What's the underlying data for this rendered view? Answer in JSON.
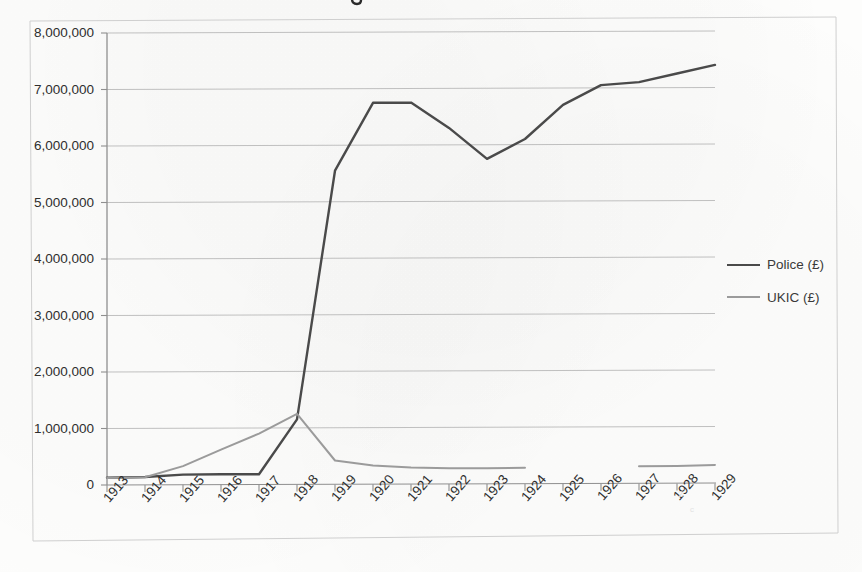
{
  "chart_data": {
    "type": "line",
    "title": "",
    "xlabel": "",
    "ylabel": "",
    "categories": [
      "1913",
      "1914",
      "1915",
      "1916",
      "1917",
      "1918",
      "1919",
      "1920",
      "1921",
      "1922",
      "1923",
      "1924",
      "1925",
      "1926",
      "1927",
      "1928",
      "1929"
    ],
    "ylim": [
      0,
      8000000
    ],
    "ytick_labels": [
      "8,000,000",
      "7,000,000",
      "6,000,000",
      "5,000,000",
      "4,000,000",
      "3,000,000",
      "2,000,000",
      "1,000,000",
      "0"
    ],
    "ytick_values": [
      8000000,
      7000000,
      6000000,
      5000000,
      4000000,
      3000000,
      2000000,
      1000000,
      0
    ],
    "grid": true,
    "grid_axis": "y",
    "legend_position": "right",
    "series": [
      {
        "name": "Police (£)",
        "color": "#4a4a4a",
        "width": 2.4,
        "values": [
          130000,
          140000,
          180000,
          185000,
          180000,
          1150000,
          5550000,
          6750000,
          6750000,
          6300000,
          5750000,
          6100000,
          6700000,
          7050000,
          7100000,
          7250000,
          7400000
        ]
      },
      {
        "name": "UKIC (£)",
        "color": "#9b9b9b",
        "width": 2.0,
        "values": [
          125000,
          135000,
          330000,
          620000,
          900000,
          1250000,
          420000,
          330000,
          290000,
          275000,
          275000,
          280000,
          null,
          null,
          300000,
          305000,
          320000
        ]
      }
    ]
  },
  "legend": {
    "items": [
      {
        "label": "Police (£)",
        "color": "#4a4a4a",
        "thickness": "2.4px"
      },
      {
        "label": "UKIC (£)",
        "color": "#9b9b9b",
        "thickness": "2px"
      }
    ]
  },
  "axes": {
    "y_ticks": [
      "8,000,000",
      "7,000,000",
      "6,000,000",
      "5,000,000",
      "4,000,000",
      "3,000,000",
      "2,000,000",
      "1,000,000",
      "0"
    ],
    "x_ticks": [
      "1913",
      "1914",
      "1915",
      "1916",
      "1917",
      "1918",
      "1919",
      "1920",
      "1921",
      "1922",
      "1923",
      "1924",
      "1925",
      "1926",
      "1927",
      "1928",
      "1929"
    ]
  }
}
